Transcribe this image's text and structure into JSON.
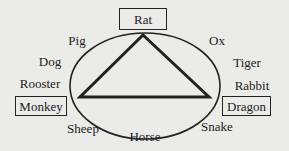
{
  "diagram": {
    "type": "zodiac-triangle",
    "highlighted": [
      {
        "label": "Rat",
        "position": "top"
      },
      {
        "label": "Monkey",
        "position": "bottom-left"
      },
      {
        "label": "Dragon",
        "position": "bottom-right"
      }
    ],
    "ring_labels": {
      "ox": "Ox",
      "tiger": "Tiger",
      "rabbit": "Rabbit",
      "snake": "Snake",
      "horse": "Horse",
      "sheep": "Sheep",
      "rooster": "Rooster",
      "dog": "Dog",
      "pig": "Pig"
    },
    "colors": {
      "background": "#ebebea",
      "stroke": "#222222"
    }
  }
}
